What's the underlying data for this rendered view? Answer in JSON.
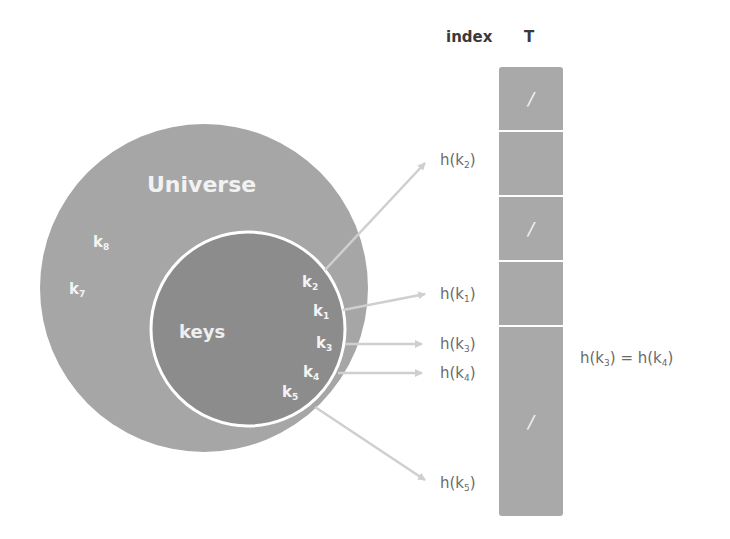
{
  "headers": {
    "index": "index",
    "table": "T"
  },
  "universe": {
    "label": "Universe",
    "outside_keys": [
      {
        "id": "k8",
        "base": "k",
        "sub": "8"
      },
      {
        "id": "k7",
        "base": "k",
        "sub": "7"
      }
    ]
  },
  "keys_set": {
    "label": "keys",
    "keys": [
      {
        "id": "k2",
        "base": "k",
        "sub": "2"
      },
      {
        "id": "k1",
        "base": "k",
        "sub": "1"
      },
      {
        "id": "k3",
        "base": "k",
        "sub": "3"
      },
      {
        "id": "k4",
        "base": "k",
        "sub": "4"
      },
      {
        "id": "k5",
        "base": "k",
        "sub": "5"
      }
    ]
  },
  "table": {
    "cells": [
      {
        "slot": 0,
        "content": "/"
      },
      {
        "slot": 1,
        "content": ""
      },
      {
        "slot": 2,
        "content": "/"
      },
      {
        "slot": 3,
        "content": ""
      },
      {
        "slot": 4,
        "content": ""
      },
      {
        "slot": 5,
        "content": "/"
      },
      {
        "slot": 6,
        "content": ""
      }
    ]
  },
  "hash_labels": [
    {
      "key": "k2",
      "prefix": "h(k",
      "sub": "2",
      "suffix": ")"
    },
    {
      "key": "k1",
      "prefix": "h(k",
      "sub": "1",
      "suffix": ")"
    },
    {
      "key": "k3",
      "prefix": "h(k",
      "sub": "3",
      "suffix": ")"
    },
    {
      "key": "k4",
      "prefix": "h(k",
      "sub": "4",
      "suffix": ")"
    },
    {
      "key": "k5",
      "prefix": "h(k",
      "sub": "5",
      "suffix": ")"
    }
  ],
  "collision_note": {
    "left_prefix": "h(k",
    "left_sub": "3",
    "middle": ") = h(k",
    "right_sub": "4",
    "suffix": ")"
  },
  "colors": {
    "universe_fill": "#a6a6a6",
    "keys_fill": "#8c8c8c",
    "keys_outline": "#ffffff",
    "table_fill": "#a9a9a9",
    "arrow": "#cfcfcf",
    "label_text": "#6a6a6a"
  }
}
